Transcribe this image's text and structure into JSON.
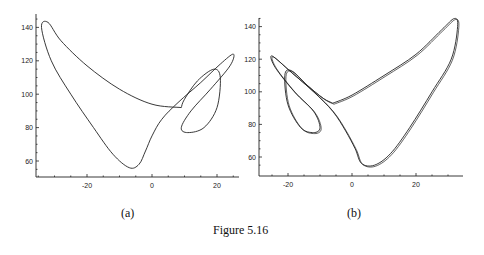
{
  "figure": {
    "caption": "Figure 5.16"
  },
  "chart_data": [
    {
      "type": "line",
      "panel_label": "(a)",
      "title": "",
      "xlabel": "",
      "ylabel": "",
      "xlim": [
        -35,
        26
      ],
      "ylim": [
        50,
        146
      ],
      "xticks": [
        -20,
        0,
        20
      ],
      "yticks": [
        60,
        80,
        100,
        120,
        140
      ],
      "description": "Phase-space trajectory (limit cycle); large lobe on left, two nested loops on right",
      "points": [
        [
          9,
          92
        ],
        [
          0,
          94
        ],
        [
          -10,
          103
        ],
        [
          -20,
          117
        ],
        [
          -28,
          132
        ],
        [
          -32,
          143
        ],
        [
          -34,
          140
        ],
        [
          -31,
          120
        ],
        [
          -25,
          100
        ],
        [
          -18,
          80
        ],
        [
          -12,
          64
        ],
        [
          -7,
          56
        ],
        [
          -4,
          58
        ],
        [
          -2,
          66
        ],
        [
          0,
          75
        ],
        [
          3,
          85
        ],
        [
          8,
          95
        ],
        [
          15,
          107
        ],
        [
          21,
          118
        ],
        [
          25,
          124
        ],
        [
          24,
          117
        ],
        [
          18,
          103
        ],
        [
          12,
          90
        ],
        [
          9,
          80
        ],
        [
          11,
          77
        ],
        [
          16,
          80
        ],
        [
          20,
          92
        ],
        [
          21,
          110
        ],
        [
          19,
          115
        ],
        [
          14,
          108
        ],
        [
          10,
          97
        ],
        [
          9,
          92
        ]
      ]
    },
    {
      "type": "line",
      "panel_label": "(b)",
      "title": "",
      "xlabel": "",
      "ylabel": "",
      "xlim": [
        -28,
        34
      ],
      "ylim": [
        50,
        146
      ],
      "xticks": [
        -20,
        0,
        20
      ],
      "yticks": [
        60,
        80,
        100,
        120,
        140
      ],
      "description": "Mirror-image phase-space trajectory; large lobe on right, two nested loops on left",
      "points": [
        [
          -6,
          93
        ],
        [
          0,
          98
        ],
        [
          10,
          110
        ],
        [
          20,
          123
        ],
        [
          28,
          138
        ],
        [
          32,
          145
        ],
        [
          33,
          140
        ],
        [
          31,
          120
        ],
        [
          25,
          100
        ],
        [
          18,
          78
        ],
        [
          12,
          62
        ],
        [
          7,
          55
        ],
        [
          3,
          56
        ],
        [
          1,
          65
        ],
        [
          -2,
          76
        ],
        [
          -6,
          88
        ],
        [
          -12,
          100
        ],
        [
          -19,
          112
        ],
        [
          -25,
          122
        ],
        [
          -24,
          115
        ],
        [
          -18,
          100
        ],
        [
          -12,
          88
        ],
        [
          -10,
          78
        ],
        [
          -12,
          75
        ],
        [
          -16,
          78
        ],
        [
          -20,
          92
        ],
        [
          -21,
          110
        ],
        [
          -19,
          113
        ],
        [
          -14,
          104
        ],
        [
          -9,
          96
        ],
        [
          -6,
          93
        ]
      ]
    }
  ]
}
